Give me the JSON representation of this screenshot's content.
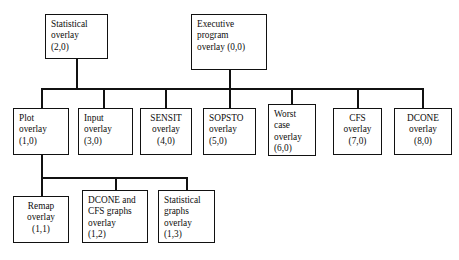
{
  "diagram": {
    "type": "hierarchy-tree",
    "line_color": "#111111",
    "box_fill": "#ffffff",
    "nodes": [
      {
        "id": "statistical-overlay",
        "text": "Statistical\noverlay\n(2,0)",
        "code": "(2,0)",
        "align": "left",
        "x": 45,
        "y": 14,
        "w": 63,
        "h": 45
      },
      {
        "id": "executive-program-overlay",
        "text": "Executive\nprogram\noverlay (0,0)",
        "code": "(0,0)",
        "align": "left",
        "x": 191,
        "y": 14,
        "w": 76,
        "h": 56
      },
      {
        "id": "plot-overlay",
        "text": "Plot\noverlay\n(1,0)",
        "code": "(1,0)",
        "align": "left",
        "x": 13,
        "y": 108,
        "w": 56,
        "h": 47
      },
      {
        "id": "input-overlay",
        "text": "Input\noverlay\n(3,0)",
        "code": "(3,0)",
        "align": "left",
        "x": 78,
        "y": 108,
        "w": 55,
        "h": 47
      },
      {
        "id": "sensit-overlay",
        "text": "SENSIT\noverlay\n(4,0)",
        "code": "(4,0)",
        "align": "center",
        "x": 140,
        "y": 108,
        "w": 52,
        "h": 47
      },
      {
        "id": "sopsto-overlay",
        "text": "SOPSTO\noverlay\n(5,0)",
        "code": "(5,0)",
        "align": "left",
        "x": 203,
        "y": 108,
        "w": 53,
        "h": 47
      },
      {
        "id": "worst-case-overlay",
        "text": "Worst\ncase\noverlay\n(6,0)",
        "code": "(6,0)",
        "align": "left",
        "x": 268,
        "y": 104,
        "w": 48,
        "h": 52
      },
      {
        "id": "cfs-overlay",
        "text": "CFS\noverlay\n(7,0)",
        "code": "(7,0)",
        "align": "center",
        "x": 333,
        "y": 108,
        "w": 49,
        "h": 47
      },
      {
        "id": "dcone-overlay",
        "text": "DCONE\noverlay\n(8,0)",
        "code": "(8,0)",
        "align": "center",
        "x": 394,
        "y": 108,
        "w": 58,
        "h": 47
      },
      {
        "id": "remap-overlay",
        "text": "Remap\noverlay\n(1,1)",
        "code": "(1,1)",
        "align": "center",
        "x": 13,
        "y": 196,
        "w": 56,
        "h": 47
      },
      {
        "id": "dcone-cfs-graphs-overlay",
        "text": "DCONE and\nCFS graphs\noverlay\n(1,2)",
        "code": "(1,2)",
        "align": "left",
        "x": 82,
        "y": 190,
        "w": 66,
        "h": 53
      },
      {
        "id": "statistical-graphs-overlay",
        "text": "Statistical\ngraphs\noverlay\n(1,3)",
        "code": "(1,3)",
        "align": "left",
        "x": 158,
        "y": 190,
        "w": 57,
        "h": 53
      }
    ],
    "edges": [
      {
        "id": "stem-statistical",
        "orient": "v",
        "x": 76,
        "y": 59,
        "len": 30
      },
      {
        "id": "stem-executive",
        "orient": "v",
        "x": 229,
        "y": 70,
        "len": 19
      },
      {
        "id": "bus-top",
        "orient": "h",
        "x": 41,
        "y": 88,
        "len": 383
      },
      {
        "id": "drop-plot",
        "orient": "v",
        "x": 41,
        "y": 88,
        "len": 21
      },
      {
        "id": "drop-input",
        "orient": "v",
        "x": 103,
        "y": 88,
        "len": 21
      },
      {
        "id": "drop-sensit",
        "orient": "v",
        "x": 165,
        "y": 88,
        "len": 21
      },
      {
        "id": "drop-sopsto",
        "orient": "v",
        "x": 229,
        "y": 88,
        "len": 21
      },
      {
        "id": "drop-worst-case",
        "orient": "v",
        "x": 291,
        "y": 88,
        "len": 17
      },
      {
        "id": "drop-cfs",
        "orient": "v",
        "x": 357,
        "y": 88,
        "len": 21
      },
      {
        "id": "drop-dcone",
        "orient": "v",
        "x": 422,
        "y": 88,
        "len": 21
      },
      {
        "id": "stem-plot",
        "orient": "v",
        "x": 41,
        "y": 155,
        "len": 22
      },
      {
        "id": "bus-bottom",
        "orient": "h",
        "x": 41,
        "y": 177,
        "len": 146
      },
      {
        "id": "drop-remap",
        "orient": "v",
        "x": 41,
        "y": 177,
        "len": 20
      },
      {
        "id": "drop-dcone-cfs-graphs",
        "orient": "v",
        "x": 115,
        "y": 177,
        "len": 14
      },
      {
        "id": "drop-statistical-graphs",
        "orient": "v",
        "x": 186,
        "y": 177,
        "len": 14
      }
    ]
  }
}
